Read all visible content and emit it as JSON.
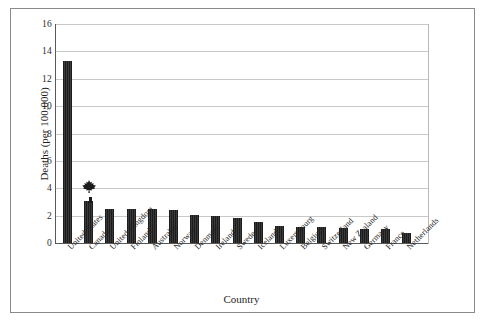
{
  "chart_data": {
    "type": "bar",
    "title": "",
    "xlabel": "Country",
    "ylabel": "Deaths (per 100,000)",
    "ylim": [
      0,
      16
    ],
    "yticks": [
      0,
      2,
      4,
      6,
      8,
      10,
      12,
      14,
      16
    ],
    "grid": true,
    "legend": "none",
    "categories": [
      "United States",
      "Canada",
      "United Kingdom",
      "Finland",
      "Australia",
      "Norway",
      "Denmark",
      "Ireland",
      "Sweden",
      "Iceland",
      "Luxembourg",
      "Belgium",
      "Switzerland",
      "New Zealand",
      "Germany",
      "France",
      "Netherlands"
    ],
    "values": [
      13.3,
      3.05,
      2.45,
      2.45,
      2.45,
      2.4,
      2.05,
      2.0,
      1.85,
      1.5,
      1.25,
      1.2,
      1.15,
      1.1,
      1.05,
      1.0,
      0.7
    ],
    "annotations": [
      {
        "name": "maple-leaf-marker",
        "icon": "maple-leaf-icon",
        "category": "Canada",
        "value": 3.05
      }
    ]
  },
  "axis": {
    "y_title": "Deaths (per 100,000)",
    "x_title": "Country",
    "tick_labels": [
      "16",
      "14",
      "12",
      "10",
      "8",
      "6",
      "4",
      "2",
      "0"
    ]
  },
  "colors": {
    "bar": "#2b2b2b",
    "grid": "#c9c9c9",
    "axis": "#595959",
    "frame": "#8a8a8a",
    "text": "#1f1f1f"
  }
}
